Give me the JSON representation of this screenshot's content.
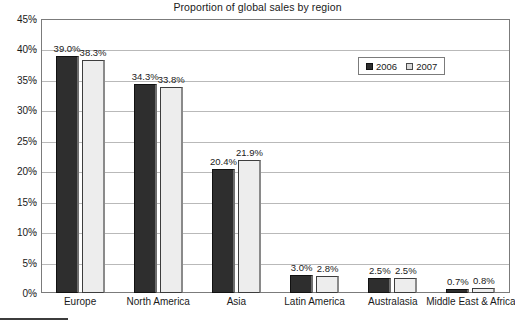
{
  "chart_data": {
    "type": "bar",
    "title": "Proportion of global sales by region",
    "xlabel": "",
    "ylabel": "",
    "ylim": [
      0,
      45
    ],
    "ytick_step": 5,
    "ytick_labels": [
      "0%",
      "5%",
      "10%",
      "15%",
      "20%",
      "25%",
      "30%",
      "35%",
      "40%",
      "45%"
    ],
    "ytick_values": [
      0,
      5,
      10,
      15,
      20,
      25,
      30,
      35,
      40,
      45
    ],
    "grid": true,
    "legend_position": "upper-right-inside",
    "categories": [
      "Europe",
      "North America",
      "Asia",
      "Latin America",
      "Australasia",
      "Middle East & Africa"
    ],
    "series": [
      {
        "name": "2006",
        "color": "#2e2e2e",
        "values": [
          39.0,
          34.3,
          20.4,
          3.0,
          2.5,
          0.7
        ],
        "labels": [
          "39.0%",
          "34.3%",
          "20.4%",
          "3.0%",
          "2.5%",
          "0.7%"
        ]
      },
      {
        "name": "2007",
        "color": "#ededed",
        "values": [
          38.3,
          33.8,
          21.9,
          2.8,
          2.5,
          0.8
        ],
        "labels": [
          "38.3%",
          "33.8%",
          "21.9%",
          "2.8%",
          "2.5%",
          "0.8%"
        ]
      }
    ]
  }
}
